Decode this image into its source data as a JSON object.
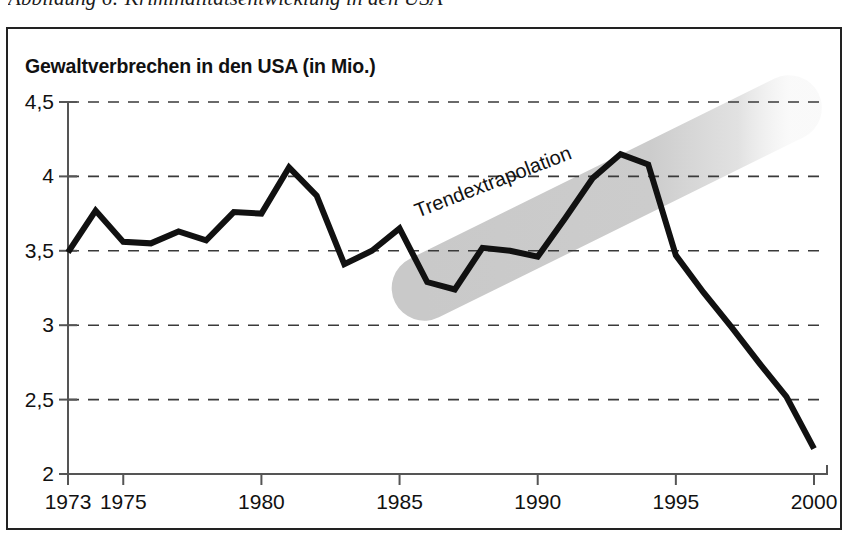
{
  "figure": {
    "caption": "Abbildung 6: Kriminalitätsentwicklung in den USA"
  },
  "chart_data": {
    "type": "line",
    "title": "Gewaltverbrechen in den USA (in Mio.)",
    "xlabel": "",
    "ylabel": "",
    "xlim": [
      1973,
      2000
    ],
    "ylim": [
      2,
      4.5
    ],
    "grid": true,
    "legend": null,
    "y_ticks": [
      4.5,
      4,
      3.5,
      3,
      2.5,
      2
    ],
    "y_tick_labels": [
      "4,5",
      "4",
      "3,5",
      "3",
      "2,5",
      "2"
    ],
    "x_ticks": [
      1973,
      1975,
      1980,
      1985,
      1990,
      1995,
      2000
    ],
    "x_tick_labels": [
      "1973",
      "1975",
      "1980",
      "1985",
      "1990",
      "1995",
      "2000"
    ],
    "x": [
      1973,
      1974,
      1975,
      1976,
      1977,
      1978,
      1979,
      1980,
      1981,
      1982,
      1983,
      1984,
      1985,
      1986,
      1987,
      1988,
      1989,
      1990,
      1991,
      1992,
      1993,
      1994,
      1995,
      1996,
      1997,
      1998,
      1999,
      2000
    ],
    "values": [
      3.49,
      3.77,
      3.56,
      3.55,
      3.63,
      3.57,
      3.76,
      3.75,
      4.06,
      3.87,
      3.41,
      3.5,
      3.65,
      3.29,
      3.24,
      3.52,
      3.5,
      3.46,
      3.72,
      3.99,
      4.15,
      4.08,
      3.47,
      3.22,
      2.99,
      2.75,
      2.52,
      2.17
    ],
    "series_name": "Gewaltverbrechen",
    "series_color": "#111111",
    "annotations": [
      {
        "text": "Trendextrapolation",
        "x": 1988.4,
        "y": 3.96,
        "rotation": -21
      }
    ],
    "trend_band": {
      "label": "Trendextrapolation",
      "color": "#c9c9c9",
      "start": {
        "x": 1985.9,
        "y": 3.25
      },
      "end": {
        "x": 1999.1,
        "y": 4.46
      },
      "thickness_units": 0.44
    }
  }
}
